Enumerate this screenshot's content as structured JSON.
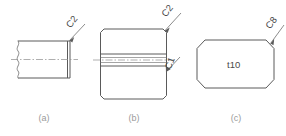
{
  "figure": {
    "background_color": "#ffffff",
    "line_color": "#5a5a5a",
    "text_color": "#4a4a4a",
    "caption_color": "#9a9a9a"
  },
  "panels": [
    {
      "id": "a",
      "caption": "(a)",
      "shape": "rectangle-with-break-and-chamfer",
      "callouts": [
        {
          "name": "chamfer-callout-c2",
          "label": "C2",
          "target": "top-right-corner"
        }
      ],
      "features": [
        "wavy-break-line-left",
        "horizontal-centerline",
        "narrow-vertical-chamfer-strip-right"
      ],
      "inner_text": ""
    },
    {
      "id": "b",
      "caption": "(b)",
      "shape": "rectangle-with-corner-chamfers",
      "callouts": [
        {
          "name": "chamfer-callout-c2",
          "label": "C2",
          "target": "top-right-corner"
        },
        {
          "name": "chamfer-callout-c1",
          "label": "C1",
          "target": "middle-band-right"
        }
      ],
      "features": [
        "horizontal-band-through-middle",
        "horizontal-centerline",
        "four-corner-chamfers"
      ],
      "inner_text": ""
    },
    {
      "id": "c",
      "caption": "(c)",
      "shape": "octagon",
      "callouts": [
        {
          "name": "chamfer-callout-c8",
          "label": "C8",
          "target": "top-right-chamfer"
        }
      ],
      "features": [
        "forty-five-degree-chamfered-corners"
      ],
      "inner_text": "t10"
    }
  ],
  "labels": {
    "panel_a_c2": "C2",
    "panel_b_c2": "C2",
    "panel_b_c1": "C1",
    "panel_c_c8": "C8",
    "panel_c_inner": "t10",
    "caption_a": "(a)",
    "caption_b": "(b)",
    "caption_c": "(c)"
  }
}
